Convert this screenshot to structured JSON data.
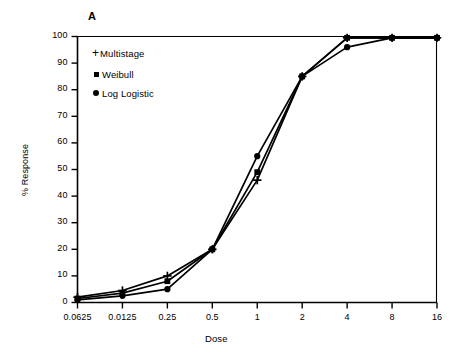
{
  "panel": {
    "label": "A"
  },
  "chart_data": {
    "type": "line",
    "title": "A",
    "xlabel": "Dose",
    "ylabel": "% Response",
    "xscale": "log2",
    "x_tick_labels": [
      "0.0625",
      "0.0125",
      "0.25",
      "0.5",
      "1",
      "2",
      "4",
      "8",
      "16"
    ],
    "x_tick_values": [
      0.0625,
      0.125,
      0.25,
      0.5,
      1,
      2,
      4,
      8,
      16
    ],
    "y_tick_labels": [
      "0",
      "10",
      "20",
      "30",
      "40",
      "50",
      "60",
      "70",
      "80",
      "90",
      "100"
    ],
    "ylim": [
      0,
      100
    ],
    "grid": false,
    "legend_position": "upper-left-inside",
    "series": [
      {
        "name": "Multistage",
        "marker": "plus",
        "color": "#000000",
        "values": [
          2.0,
          4.5,
          10.0,
          20.0,
          46.0,
          85.0,
          99.5,
          99.5,
          99.5
        ]
      },
      {
        "name": "Weibull",
        "marker": "square",
        "color": "#000000",
        "values": [
          1.5,
          3.5,
          8.0,
          20.0,
          49.0,
          85.0,
          99.5,
          99.5,
          99.5
        ]
      },
      {
        "name": "Log Logistic",
        "marker": "circle",
        "color": "#000000",
        "values": [
          1.0,
          2.5,
          5.0,
          20.0,
          55.0,
          85.0,
          96.0,
          99.5,
          99.5
        ]
      }
    ]
  },
  "legend": {
    "items": [
      {
        "label": "Multistage",
        "marker": "plus-marker"
      },
      {
        "label": "Weibull",
        "marker": "square-marker"
      },
      {
        "label": "Log Logistic",
        "marker": "circle-marker"
      }
    ]
  }
}
